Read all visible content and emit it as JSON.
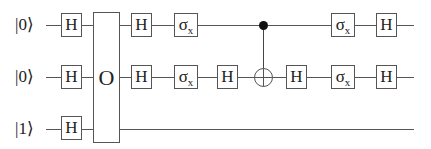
{
  "qubits": [
    {
      "label": "|0⟩",
      "y": 25
    },
    {
      "label": "|0⟩",
      "y": 77
    },
    {
      "label": "|1⟩",
      "y": 129
    }
  ],
  "oracle": {
    "label": "O"
  },
  "gates": {
    "h": "H",
    "sigma": "σ",
    "sigma_sub": "x"
  },
  "colors": {
    "line": "#555555",
    "text": "#222222",
    "control": "#111111"
  }
}
